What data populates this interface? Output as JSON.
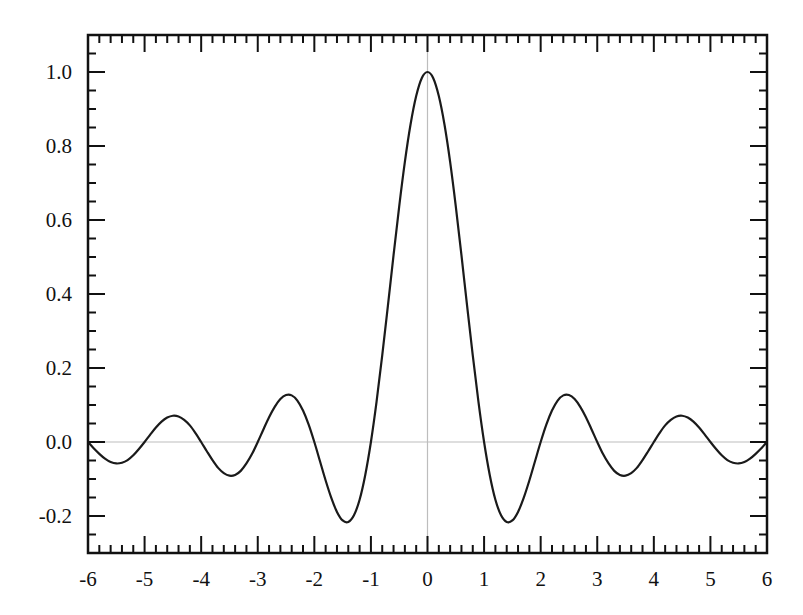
{
  "chart_data": {
    "type": "line",
    "title": "",
    "xlabel": "",
    "ylabel": "",
    "xlim": [
      -6,
      6
    ],
    "ylim": [
      -0.3,
      1.1
    ],
    "grid": false,
    "legend": null,
    "x_ticks": [
      -6,
      -5,
      -4,
      -3,
      -2,
      -1,
      0,
      1,
      2,
      3,
      4,
      5,
      6
    ],
    "x_tick_labels": [
      "-6",
      "-5",
      "-4",
      "-3",
      "-2",
      "-1",
      "0",
      "1",
      "2",
      "3",
      "4",
      "5",
      "6"
    ],
    "x_minor_step": 0.2,
    "y_ticks": [
      -0.2,
      0.0,
      0.2,
      0.4,
      0.6,
      0.8,
      1.0
    ],
    "y_tick_labels": [
      "-0.2",
      "0.0",
      "0.2",
      "0.4",
      "0.6",
      "0.8",
      "1.0"
    ],
    "y_minor_step": 0.05,
    "reference_lines": [
      {
        "orientation": "horizontal",
        "value": 0,
        "color": "#bdbdbd"
      },
      {
        "orientation": "vertical",
        "value": 0,
        "color": "#bdbdbd"
      }
    ],
    "series": [
      {
        "name": "sinc(x) = sin(πx)/(πx)",
        "color": "#1a1a1a",
        "x_start": 0,
        "x_step": 0.1,
        "symmetric": true,
        "values_nonnegative_x": [
          1.0,
          0.984,
          0.935,
          0.858,
          0.757,
          0.637,
          0.505,
          0.368,
          0.234,
          0.109,
          0.0,
          -0.089,
          -0.156,
          -0.198,
          -0.216,
          -0.212,
          -0.189,
          -0.151,
          -0.104,
          -0.052,
          0.0,
          0.047,
          0.085,
          0.112,
          0.126,
          0.127,
          0.116,
          0.095,
          0.067,
          0.034,
          0.0,
          -0.032,
          -0.058,
          -0.078,
          -0.089,
          -0.091,
          -0.084,
          -0.07,
          -0.049,
          -0.025,
          0.0,
          0.024,
          0.045,
          0.06,
          0.069,
          0.071,
          0.066,
          0.055,
          0.039,
          0.02,
          0.0,
          -0.019,
          -0.036,
          -0.049,
          -0.056,
          -0.058,
          -0.054,
          -0.045,
          -0.032,
          -0.017,
          0.0
        ]
      }
    ]
  },
  "layout": {
    "plot_left": 88,
    "plot_right": 767,
    "plot_top": 35,
    "plot_bottom": 553
  }
}
